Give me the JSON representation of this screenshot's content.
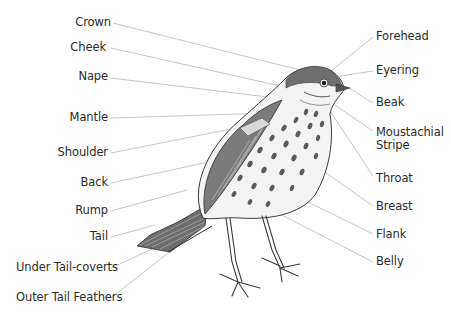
{
  "diagram": {
    "colors": {
      "text": "#2b2b2b",
      "leader_line": "#b8b8b8",
      "ink": "#3a3a3a",
      "background": "#ffffff"
    },
    "labels_left": [
      {
        "id": "crown",
        "text": "Crown"
      },
      {
        "id": "cheek",
        "text": "Cheek"
      },
      {
        "id": "nape",
        "text": "Nape"
      },
      {
        "id": "mantle",
        "text": "Mantle"
      },
      {
        "id": "shoulder",
        "text": "Shoulder"
      },
      {
        "id": "back",
        "text": "Back"
      },
      {
        "id": "rump",
        "text": "Rump"
      },
      {
        "id": "tail",
        "text": "Tail"
      },
      {
        "id": "under-tail-coverts",
        "text": "Under Tail-coverts"
      },
      {
        "id": "outer-tail-feathers",
        "text": "Outer Tail Feathers"
      }
    ],
    "labels_right": [
      {
        "id": "forehead",
        "text": "Forehead"
      },
      {
        "id": "eyering",
        "text": "Eyering"
      },
      {
        "id": "beak",
        "text": "Beak"
      },
      {
        "id": "moustachial-stripe",
        "text": "Moustachial",
        "text2": "Stripe"
      },
      {
        "id": "throat",
        "text": "Throat"
      },
      {
        "id": "breast",
        "text": "Breast"
      },
      {
        "id": "flank",
        "text": "Flank"
      },
      {
        "id": "belly",
        "text": "Belly"
      }
    ]
  }
}
